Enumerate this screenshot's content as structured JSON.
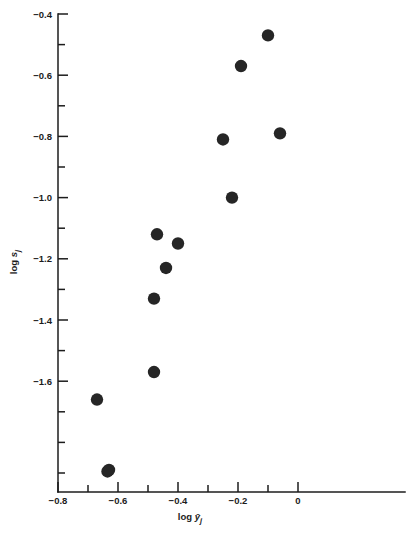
{
  "chart_data": {
    "type": "scatter",
    "title": "",
    "xlabel": "log ȳⱼ",
    "ylabel": "log sⱼ",
    "xlabel_parts": {
      "prefix": "log ",
      "variable": "ȳ",
      "subscript": "j"
    },
    "ylabel_parts": {
      "prefix": "log ",
      "variable": "s",
      "subscript": "j"
    },
    "xlim": [
      -0.8,
      0.1
    ],
    "ylim": [
      -1.93,
      -0.4
    ],
    "grid": false,
    "legend": null,
    "x_ticks": [
      -0.8,
      -0.6,
      -0.4,
      -0.2,
      0
    ],
    "x_tick_labels": [
      "−0.8",
      "−0.6",
      "−0.4",
      "−0.2",
      "0"
    ],
    "x_minor_ticks": [
      -0.7,
      -0.5,
      -0.3,
      -0.1
    ],
    "y_ticks": [
      -0.4,
      -0.6,
      -0.8,
      -1.0,
      -1.2,
      -1.4,
      -1.6
    ],
    "y_tick_labels": [
      "−0.4",
      "−0.6",
      "−0.8",
      "−1.0",
      "−1.2",
      "−1.4",
      "−1.6"
    ],
    "y_minor_ticks": [
      -0.5,
      -0.7,
      -0.9,
      -1.1,
      -1.3,
      -1.5,
      -1.7,
      -1.8,
      -1.9
    ],
    "marker": {
      "shape": "circle",
      "color": "#262626",
      "size": 6.2
    },
    "points": [
      {
        "x": -0.1,
        "y": -0.47
      },
      {
        "x": -0.19,
        "y": -0.57
      },
      {
        "x": -0.25,
        "y": -0.81
      },
      {
        "x": -0.06,
        "y": -0.79
      },
      {
        "x": -0.22,
        "y": -1.0
      },
      {
        "x": -0.47,
        "y": -1.12
      },
      {
        "x": -0.4,
        "y": -1.15
      },
      {
        "x": -0.44,
        "y": -1.23
      },
      {
        "x": -0.48,
        "y": -1.33
      },
      {
        "x": -0.48,
        "y": -1.57
      },
      {
        "x": -0.67,
        "y": -1.66
      },
      {
        "x": -0.63,
        "y": -1.89
      },
      {
        "x": -0.635,
        "y": -1.895
      }
    ]
  },
  "figure": {
    "background_color": "#ffffff",
    "axis_color": "#1c1c1c",
    "marker_color": "#262626"
  }
}
